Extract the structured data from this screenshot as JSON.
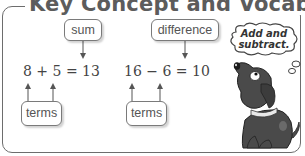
{
  "title": "Key Concept and Vocabulary",
  "labels": {
    "sum": "sum",
    "difference": "difference",
    "terms_left": "terms",
    "terms_right": "terms"
  },
  "equations": {
    "addition": "8 + 5 = 13",
    "subtraction": "16 − 6 = 10"
  },
  "thought_bubble": {
    "line1": "Add and",
    "line2": "subtract."
  },
  "colors": {
    "border": "#6d6d6d",
    "text": "#555555",
    "dog": "#4a4a4a"
  }
}
